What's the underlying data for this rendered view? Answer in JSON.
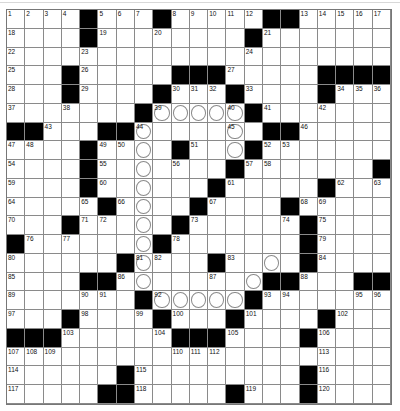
{
  "puzzle": {
    "rows": 21,
    "cols": 21,
    "legend": {
      "#": "block",
      ".": "open",
      "c": "circled"
    },
    "grid": [
      [
        "1",
        "2",
        "3",
        "4",
        "#",
        "5",
        "6",
        "7",
        "#",
        "8",
        "9",
        "10",
        "11",
        "12",
        "#",
        "#",
        "13",
        "14",
        "15",
        "16",
        "17"
      ],
      [
        "18",
        ".",
        ".",
        ".",
        "#",
        "19",
        ".",
        ".",
        "20",
        ".",
        ".",
        ".",
        ".",
        "#",
        "21",
        ".",
        ".",
        ".",
        ".",
        ".",
        "."
      ],
      [
        "22",
        ".",
        ".",
        ".",
        "23",
        ".",
        ".",
        ".",
        ".",
        ".",
        ".",
        ".",
        ".",
        "24",
        ".",
        ".",
        ".",
        ".",
        ".",
        ".",
        "."
      ],
      [
        "25",
        ".",
        ".",
        "#",
        "26",
        ".",
        ".",
        ".",
        ".",
        "#",
        "#",
        "#",
        "27",
        ".",
        ".",
        ".",
        ".",
        "#",
        "#",
        "#",
        "#"
      ],
      [
        "28",
        ".",
        ".",
        "#",
        "29",
        ".",
        ".",
        ".",
        "#",
        "30",
        "31",
        "32",
        "#",
        "33",
        ".",
        ".",
        ".",
        "#",
        "34",
        "35",
        "36"
      ],
      [
        "37",
        ".",
        ".",
        "38",
        ".",
        ".",
        ".",
        "#",
        "39c",
        "c",
        "c",
        "c",
        "40c",
        "#",
        "41",
        ".",
        ".",
        "42",
        ".",
        ".",
        "."
      ],
      [
        "#",
        "#",
        "43",
        ".",
        ".",
        "#",
        "#",
        "44c",
        ".",
        ".",
        ".",
        ".",
        "45c",
        ".",
        "#",
        "#",
        "46",
        ".",
        ".",
        ".",
        "."
      ],
      [
        "47",
        "48",
        ".",
        ".",
        "#",
        "49",
        "50",
        "c",
        ".",
        "#",
        "51",
        ".",
        "c",
        "#",
        "52",
        "53",
        ".",
        ".",
        ".",
        ".",
        "."
      ],
      [
        "54",
        ".",
        ".",
        ".",
        "#",
        "55",
        ".",
        "c",
        ".",
        "56",
        ".",
        ".",
        "#",
        "57",
        "58",
        ".",
        ".",
        ".",
        ".",
        ".",
        "#"
      ],
      [
        "59",
        ".",
        ".",
        ".",
        "#",
        "60",
        ".",
        "c",
        ".",
        ".",
        ".",
        "#",
        "61",
        ".",
        ".",
        ".",
        ".",
        "#",
        "62",
        ".",
        "63"
      ],
      [
        "64",
        ".",
        ".",
        ".",
        "65",
        "#",
        "66",
        "c",
        ".",
        ".",
        "#",
        "67",
        ".",
        ".",
        ".",
        "#",
        "68",
        "69",
        ".",
        ".",
        "."
      ],
      [
        "70",
        ".",
        ".",
        "#",
        "71",
        "72",
        ".",
        "c",
        ".",
        "#",
        "73",
        ".",
        ".",
        ".",
        ".",
        "74",
        "#",
        "75",
        ".",
        ".",
        "."
      ],
      [
        "#",
        "76",
        ".",
        "77",
        ".",
        ".",
        ".",
        "c",
        "#",
        "78",
        ".",
        ".",
        ".",
        ".",
        ".",
        ".",
        "#",
        "79",
        ".",
        ".",
        "."
      ],
      [
        "80",
        ".",
        ".",
        ".",
        ".",
        ".",
        "#",
        "81c",
        "82",
        ".",
        ".",
        "#",
        "83",
        ".",
        "c",
        ".",
        "#",
        "84",
        ".",
        ".",
        "."
      ],
      [
        "85",
        ".",
        ".",
        ".",
        "#",
        "#",
        "86",
        "c",
        ".",
        ".",
        ".",
        "87",
        ".",
        "c",
        "#",
        "#",
        "88",
        ".",
        ".",
        "#",
        "#"
      ],
      [
        "89",
        ".",
        ".",
        ".",
        "90",
        "91",
        ".",
        "#",
        "92c",
        "c",
        "c",
        "c",
        "c",
        "#",
        "93",
        "94",
        ".",
        ".",
        ".",
        "95",
        "96"
      ],
      [
        "97",
        ".",
        ".",
        "#",
        "98",
        ".",
        ".",
        "99",
        "#",
        "100",
        ".",
        ".",
        "#",
        "101",
        ".",
        ".",
        ".",
        "#",
        "102",
        ".",
        "."
      ],
      [
        "#",
        "#",
        "#",
        "103",
        ".",
        ".",
        ".",
        ".",
        "104",
        "#",
        "#",
        "#",
        "105",
        ".",
        ".",
        ".",
        "#",
        "106",
        ".",
        ".",
        "."
      ],
      [
        "107",
        "108",
        "109",
        ".",
        ".",
        ".",
        ".",
        ".",
        ".",
        "110",
        "111",
        "112",
        ".",
        ".",
        ".",
        ".",
        ".",
        "113",
        ".",
        ".",
        "."
      ],
      [
        "114",
        ".",
        ".",
        ".",
        ".",
        ".",
        "#",
        "115",
        ".",
        ".",
        ".",
        ".",
        ".",
        ".",
        ".",
        ".",
        "#",
        "116",
        ".",
        ".",
        "."
      ],
      [
        "117",
        ".",
        ".",
        ".",
        ".",
        "#",
        "#",
        "118",
        ".",
        ".",
        ".",
        ".",
        "#",
        "119",
        ".",
        ".",
        "#",
        "120",
        ".",
        ".",
        "."
      ]
    ]
  },
  "colors": {
    "block": "#000000",
    "cell": "#ffffff",
    "gridline": "#8a8a8a",
    "circle": "#8a8a8a",
    "number": "#111111"
  }
}
